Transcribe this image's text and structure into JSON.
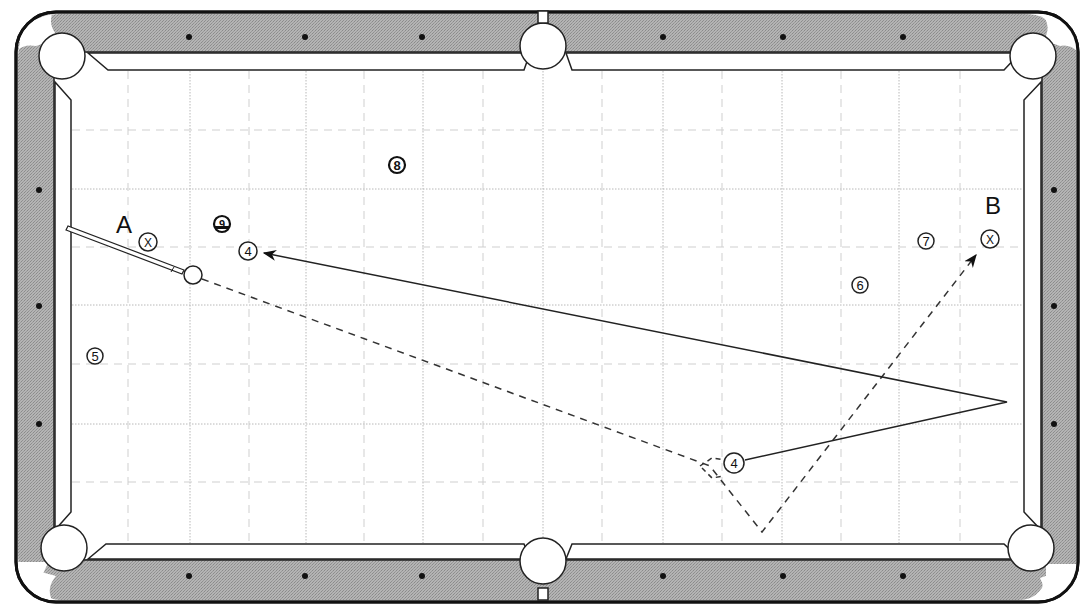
{
  "diagram": {
    "type": "pool-table-shot-diagram",
    "labels": {
      "start_position": "A",
      "target_position": "B"
    },
    "markers": {
      "cue_ball_position_a": "X",
      "cue_ball_position_b": "X"
    },
    "balls": [
      {
        "number": "4",
        "role": "object-ball-original",
        "x": 248,
        "y": 251
      },
      {
        "number": "4",
        "role": "object-ball-target",
        "x": 734,
        "y": 463
      },
      {
        "number": "5",
        "x": 95,
        "y": 356
      },
      {
        "number": "6",
        "x": 860,
        "y": 285
      },
      {
        "number": "7",
        "x": 926,
        "y": 241
      },
      {
        "number": "8",
        "x": 397,
        "y": 165
      },
      {
        "number": "9",
        "x": 222,
        "y": 224
      }
    ],
    "paths": [
      {
        "name": "cue-ball-path",
        "style": "dashed",
        "points": [
          [
            193,
            276
          ],
          [
            712,
            468
          ],
          [
            762,
            532
          ],
          [
            978,
            253
          ]
        ],
        "arrow_end": true
      },
      {
        "name": "object-ball-path",
        "style": "solid",
        "points": [
          [
            745,
            460
          ],
          [
            1007,
            402
          ],
          [
            262,
            253
          ]
        ],
        "arrow_end": true
      }
    ],
    "colors": {
      "rail": "#a8a8a8",
      "cloth": "#ffffff",
      "line": "#222222",
      "grid": "#b8b8b8"
    }
  }
}
